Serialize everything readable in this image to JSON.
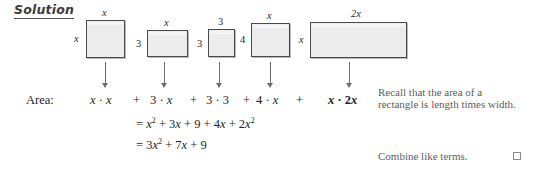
{
  "heading": {
    "label": "Solution"
  },
  "figure": {
    "rectangles": [
      {
        "name": "rect-x-by-x",
        "top_label": "x",
        "left_label": "x"
      },
      {
        "name": "rect-3-by-x",
        "top_label": "x",
        "left_label": "3"
      },
      {
        "name": "rect-3-by-3",
        "top_label": "3",
        "left_label": "3"
      },
      {
        "name": "rect-4-by-x",
        "top_label": "x",
        "left_label": "4"
      },
      {
        "name": "rect-x-by-2x",
        "top_label": "2x",
        "left_label": "x"
      }
    ]
  },
  "area_row": {
    "label": "Area:",
    "terms": [
      {
        "text": "x · x",
        "bold": false
      },
      {
        "text": "3 · x",
        "bold": false
      },
      {
        "text": "3 · 3",
        "bold": false
      },
      {
        "text": "4 · x",
        "bold": false
      },
      {
        "text": "x · 2x",
        "bold": true
      }
    ],
    "plus": "+"
  },
  "equations": [
    {
      "id": "line-expand",
      "text": "= x² + 3x + 9 + 4x + 2x²"
    },
    {
      "id": "line-simplify",
      "text": "= 3x² + 7x + 9"
    }
  ],
  "notes": {
    "recall_line1": "Recall that the area of a",
    "recall_line2": "rectangle is length times width.",
    "combine": "Combine like terms."
  },
  "colors": {
    "rect_fill": "#ececec",
    "rect_border": "#4a4a4a",
    "arrow": "#6e6e6e",
    "note_text": "#5d5d5d",
    "math_text": "#231f20"
  }
}
